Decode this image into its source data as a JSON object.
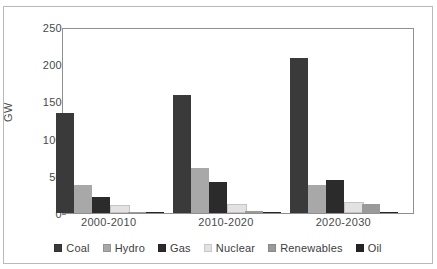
{
  "figure": {
    "clipped_top_text": "",
    "axis_title_y": "GW"
  },
  "legend": {
    "position": "bottom",
    "items": [
      {
        "label": "Coal",
        "color": "#3a3a3a",
        "swatch": "legend-swatch-coal"
      },
      {
        "label": "Hydro",
        "color": "#a8a8a8",
        "swatch": "legend-swatch-hydro"
      },
      {
        "label": "Gas",
        "color": "#2b2b2b",
        "swatch": "legend-swatch-gas"
      },
      {
        "label": "Nuclear",
        "color": "#e2e2e2",
        "swatch": "legend-swatch-nuclear"
      },
      {
        "label": "Renewables",
        "color": "#9a9a9a",
        "swatch": "legend-swatch-renewables"
      },
      {
        "label": "Oil",
        "color": "#252525",
        "swatch": "legend-swatch-oil"
      }
    ]
  },
  "yaxis": {
    "ticks": [
      "0",
      "50",
      "100",
      "150",
      "200",
      "250"
    ],
    "label": "GW"
  },
  "xaxis": {
    "ticks": [
      "2000-2010",
      "2010-2020",
      "2020-2030"
    ]
  },
  "chart_data": {
    "type": "bar",
    "title": "",
    "xlabel": "",
    "ylabel": "GW",
    "ylim": [
      0,
      250
    ],
    "yticks": [
      0,
      50,
      100,
      150,
      200,
      250
    ],
    "grid": false,
    "legend_position": "bottom",
    "categories": [
      "2000-2010",
      "2010-2020",
      "2020-2030"
    ],
    "series": [
      {
        "name": "Coal",
        "color": "#3a3a3a",
        "values": [
          134,
          159,
          208
        ]
      },
      {
        "name": "Hydro",
        "color": "#a8a8a8",
        "values": [
          37,
          60,
          38
        ]
      },
      {
        "name": "Gas",
        "color": "#2b2b2b",
        "values": [
          21,
          42,
          45
        ]
      },
      {
        "name": "Nuclear",
        "color": "#e2e2e2",
        "values": [
          8,
          10,
          12
        ]
      },
      {
        "name": "Renewables",
        "color": "#9a9a9a",
        "values": [
          2,
          3,
          12
        ]
      },
      {
        "name": "Oil",
        "color": "#252525",
        "values": [
          1,
          1.5,
          1
        ]
      }
    ]
  }
}
